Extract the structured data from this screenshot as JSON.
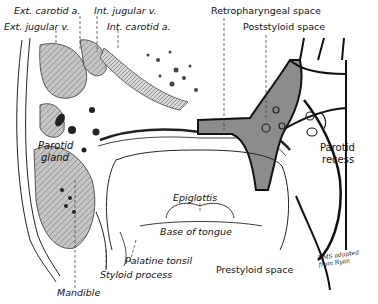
{
  "figure": {
    "type": "anatomical illustration",
    "colors": {
      "ink": "#111111",
      "shaded_space": "#8c8c8c",
      "gland_fill": "#b9b9b9",
      "background": "#ffffff"
    }
  },
  "labels": {
    "ext_carotid": "Ext. carotid a.",
    "int_jugular": "Int. jugular v.",
    "ext_jugular": "Ext. jugular v.",
    "int_carotid": "Int. carotid a.",
    "retropharyngeal": "Retropharyngeal space",
    "poststyloid": "Poststyloid space",
    "parotid_gland_1": "Parotid",
    "parotid_gland_2": "gland",
    "parotid_recess_1": "Parotid",
    "parotid_recess_2": "recess",
    "epiglottis": "Epiglottis",
    "base_of_tongue": "Base of tongue",
    "palatine_tonsil": "Palatine tonsil",
    "styloid_process": "Styloid process",
    "prestyloid": "Prestyloid space",
    "mandible": "Mandible"
  },
  "signature": {
    "line1": "DMS adapted",
    "line2": "from Ryan"
  }
}
